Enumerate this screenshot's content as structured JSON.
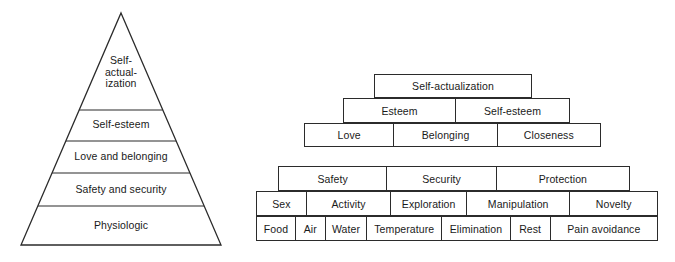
{
  "figure": {
    "line_color": "#2b2b2b",
    "text_color": "#1a1a1a",
    "background_color": "#ffffff"
  },
  "left_pyramid": {
    "name": "classic-triangle-hierarchy",
    "levels": [
      {
        "label": "Self-\nactual-\nization",
        "plain": "Self-actualization"
      },
      {
        "label": "Self-esteem",
        "plain": "Self-esteem"
      },
      {
        "label": "Love and belonging",
        "plain": "Love and belonging"
      },
      {
        "label": "Safety and security",
        "plain": "Safety and security"
      },
      {
        "label": "Physiologic",
        "plain": "Physiologic"
      }
    ]
  },
  "right_pyramid": {
    "name": "stepped-block-hierarchy",
    "rows": [
      {
        "row_name": "self-actualization-row",
        "cells": [
          "Self-actualization"
        ]
      },
      {
        "row_name": "esteem-row",
        "cells": [
          "Esteem",
          "Self-esteem"
        ]
      },
      {
        "row_name": "love-row",
        "cells": [
          "Love",
          "Belonging",
          "Closeness"
        ]
      },
      {
        "row_name": "safety-row",
        "cells": [
          "Safety",
          "Security",
          "Protection"
        ]
      },
      {
        "row_name": "stimulation-row",
        "cells": [
          "Sex",
          "Activity",
          "Exploration",
          "Manipulation",
          "Novelty"
        ]
      },
      {
        "row_name": "physiologic-row",
        "cells": [
          "Food",
          "Air",
          "Water",
          "Temperature",
          "Elimination",
          "Rest",
          "Pain avoidance"
        ]
      }
    ]
  }
}
